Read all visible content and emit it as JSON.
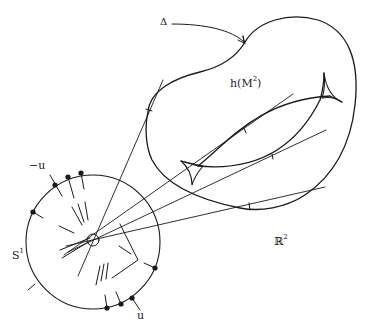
{
  "figure": {
    "labels": {
      "delta": "Δ",
      "region": "h(M",
      "region_sup": "2",
      "region_close": ")",
      "circle": "S",
      "circle_sup": "1",
      "plane": "ℝ",
      "plane_sup": "2",
      "u_pos": "u",
      "u_neg": "−u"
    },
    "colors": {
      "ink": "#1a1a1a",
      "background": "#ffffff",
      "stipple": "#555555",
      "cusp_fill": "#9a9a9a"
    },
    "elements": {
      "region": "stippled blob h(M²) with boundary Δ",
      "curve": "closed curve with two cusps (swallowtail-like) inside region",
      "circle": "unit circle S¹ with marked points and normal ticks",
      "rays": "lines from circle centre tangent to region boundary"
    }
  }
}
